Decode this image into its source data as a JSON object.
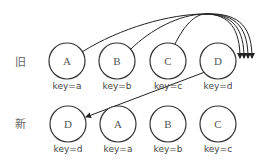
{
  "diagram": {
    "rows": [
      {
        "label": "旧",
        "nodes": [
          {
            "letter": "A",
            "key": "key=a"
          },
          {
            "letter": "B",
            "key": "key=b"
          },
          {
            "letter": "C",
            "key": "key=c"
          },
          {
            "letter": "D",
            "key": "key=d"
          }
        ]
      },
      {
        "label": "新",
        "nodes": [
          {
            "letter": "D",
            "key": "key=d"
          },
          {
            "letter": "A",
            "key": "key=a"
          },
          {
            "letter": "B",
            "key": "key=b"
          },
          {
            "letter": "C",
            "key": "key=c"
          }
        ]
      }
    ],
    "edges": [
      {
        "from": "旧.A",
        "to": "after 旧.D",
        "description": "A moved to end"
      },
      {
        "from": "旧.B",
        "to": "after 旧.D",
        "description": "B moved to end"
      },
      {
        "from": "旧.C",
        "to": "after 旧.D",
        "description": "C moved to end"
      },
      {
        "from": "旧.D",
        "to": "新.D",
        "description": "D becomes first"
      }
    ],
    "colors": {
      "stroke": "#333333",
      "text": "#555555",
      "label": "#666666"
    }
  }
}
